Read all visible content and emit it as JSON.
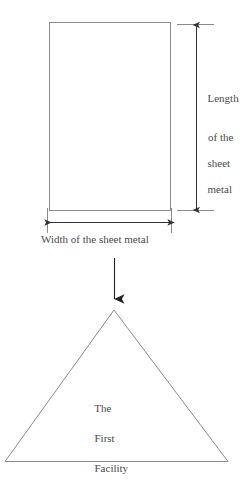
{
  "diagram": {
    "title_text_present": false,
    "stroke_color": "#8c8c8c",
    "arrow_color": "#333333",
    "text_color": "#4a4a4a",
    "background_color": "#ffffff",
    "sheet_rectangle": {
      "name": "sheet-metal-rectangle",
      "x": 49,
      "y": 22,
      "width": 122,
      "height": 189
    },
    "length_dimension": {
      "label_lines": [
        "Length",
        "of the",
        "sheet",
        "metal"
      ],
      "label_full": "Length of the sheet metal",
      "axis_x": 196,
      "top_y": 24,
      "bottom_y": 210
    },
    "width_dimension": {
      "label": "Width of the sheet metal",
      "axis_y": 222,
      "left_x": 47,
      "right_x": 171
    },
    "flow_arrow": {
      "name": "downward-flow-arrow",
      "x": 114,
      "from_y": 258,
      "to_y": 300
    },
    "facility_triangle": {
      "name": "first-facility-triangle",
      "apex_x": 114,
      "apex_y": 310,
      "base_left_x": 5,
      "base_right_x": 228,
      "base_y": 462,
      "label_lines": [
        "The",
        "First",
        "Facility"
      ],
      "label_full": "The First Facility"
    }
  }
}
